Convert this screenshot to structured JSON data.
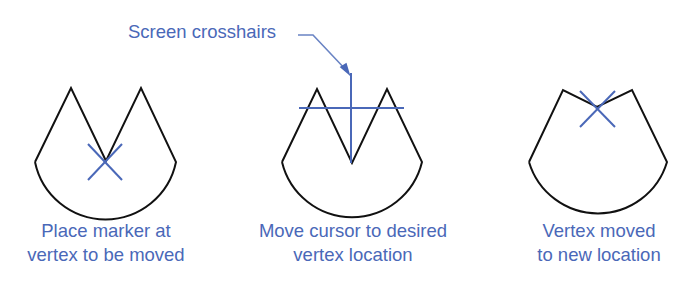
{
  "callout": {
    "text": "Screen crosshairs"
  },
  "panels": [
    {
      "caption_line1": "Place marker at",
      "caption_line2": "vertex to be moved"
    },
    {
      "caption_line1": "Move cursor to desired",
      "caption_line2": "vertex location"
    },
    {
      "caption_line1": "Vertex moved",
      "caption_line2": "to new location"
    }
  ],
  "colors": {
    "outline": "#111111",
    "accent": "#4a68b8"
  }
}
